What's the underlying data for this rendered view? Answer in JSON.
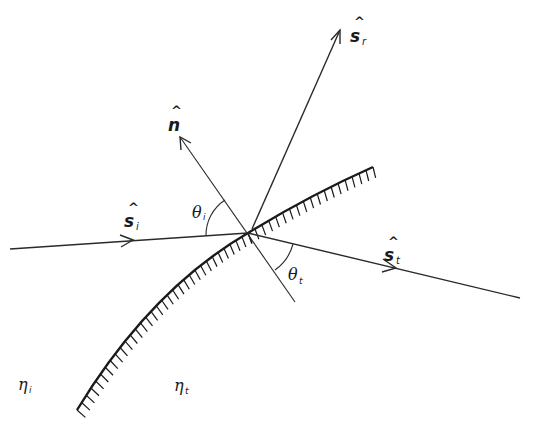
{
  "diagram": {
    "background": "#ffffff",
    "line_color": "#2a2a2a",
    "vectors": {
      "normal": {
        "symbol": "n",
        "hat": "^",
        "subscript": ""
      },
      "reflected": {
        "symbol": "s",
        "hat": "^",
        "subscript": "r"
      },
      "incident": {
        "symbol": "s",
        "hat": "^",
        "subscript": "i"
      },
      "transmitted": {
        "symbol": "s",
        "hat": "^",
        "subscript": "t"
      }
    },
    "angles": {
      "incidence": {
        "symbol": "θ",
        "subscript": "i"
      },
      "transmission": {
        "symbol": "θ",
        "subscript": "t"
      }
    },
    "media": {
      "incident_medium": {
        "symbol": "η",
        "subscript": "i"
      },
      "transmitted_medium": {
        "symbol": "η",
        "subscript": "t"
      }
    }
  }
}
